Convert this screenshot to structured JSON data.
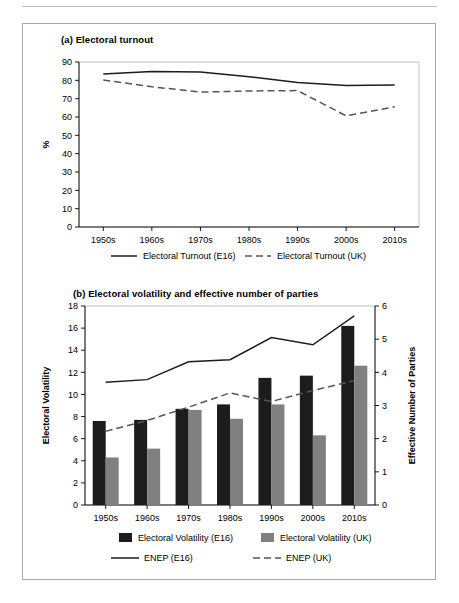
{
  "figure": {
    "panel_a_title": "(a) Electoral turnout",
    "panel_b_title": "(b) Electoral volatility and effective number of parties"
  },
  "colors": {
    "bar_dark": "#1c1c1c",
    "bar_grey": "#808080",
    "line_solid": "#1c1c1c",
    "line_dashed": "#555555",
    "frame": "#b5b5b5",
    "axis": "#000000",
    "box_border": "#a8a8a8"
  },
  "chart_data": [
    {
      "id": "panel-a",
      "type": "line",
      "title": "(a) Electoral turnout",
      "xlabel": "",
      "ylabel": "%",
      "categories": [
        "1950s",
        "1960s",
        "1970s",
        "1980s",
        "1990s",
        "2000s",
        "2010s"
      ],
      "ylim": [
        0,
        90
      ],
      "yticks": [
        0,
        10,
        20,
        30,
        40,
        50,
        60,
        70,
        80,
        90
      ],
      "grid": false,
      "legend_position": "bottom",
      "series": [
        {
          "name": "Electoral Turnout (E16)",
          "style": "solid",
          "values": [
            83.5,
            84.8,
            84.5,
            82.0,
            78.8,
            77.2,
            77.4
          ]
        },
        {
          "name": "Electoral Turnout (UK)",
          "style": "dashed",
          "values": [
            80.2,
            76.5,
            73.6,
            74.2,
            74.4,
            60.6,
            65.6
          ]
        }
      ]
    },
    {
      "id": "panel-b",
      "type": "bar",
      "title": "(b) Electoral volatility and effective number of parties",
      "xlabel": "",
      "ylabel": "Electoral Volatility",
      "y2label": "Effective Number of Parties",
      "categories": [
        "1950s",
        "1960s",
        "1970s",
        "1980s",
        "1990s",
        "2000s",
        "2010s"
      ],
      "ylim": [
        0,
        18
      ],
      "yticks": [
        0,
        2,
        4,
        6,
        8,
        10,
        12,
        14,
        16,
        18
      ],
      "y2lim": [
        0,
        6
      ],
      "y2ticks": [
        0,
        1,
        2,
        3,
        4,
        5,
        6
      ],
      "grid": false,
      "legend_position": "bottom",
      "series": [
        {
          "name": "Electoral Volatility (E16)",
          "style": "bar-dark",
          "axis": "left",
          "values": [
            7.6,
            7.7,
            8.7,
            9.1,
            11.5,
            11.7,
            16.2
          ]
        },
        {
          "name": "Electoral Volatility (UK)",
          "style": "bar-grey",
          "axis": "left",
          "values": [
            4.3,
            5.1,
            8.6,
            7.8,
            9.1,
            6.3,
            12.6
          ]
        },
        {
          "name": "ENEP (E16)",
          "style": "solid",
          "axis": "right",
          "values": [
            3.7,
            3.78,
            4.32,
            4.38,
            5.05,
            4.83,
            5.7
          ]
        },
        {
          "name": "ENEP (UK)",
          "style": "dashed",
          "axis": "right",
          "values": [
            2.22,
            2.55,
            2.95,
            3.38,
            3.12,
            3.45,
            3.75
          ]
        }
      ]
    }
  ]
}
